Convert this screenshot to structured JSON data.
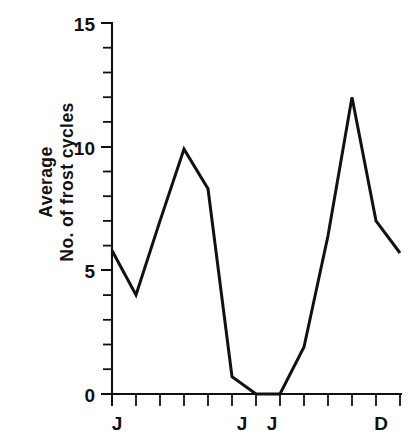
{
  "chart_data": {
    "type": "line",
    "title": "",
    "subtitle": "",
    "xlabel": "",
    "ylabel": "Average No. of frost cycles",
    "ylabel_lines": [
      "Average",
      "No. of frost cycles"
    ],
    "x": [
      "J",
      "F",
      "M",
      "A",
      "M",
      "J",
      "J",
      "A",
      "S",
      "O",
      "N",
      "D",
      ""
    ],
    "categories": [
      "J",
      "F",
      "M",
      "A",
      "M",
      "J",
      "J",
      "A",
      "S",
      "O",
      "N",
      "D",
      ""
    ],
    "values": [
      5.8,
      4.0,
      7.0,
      9.9,
      8.3,
      0.7,
      0.0,
      0.0,
      1.9,
      6.4,
      12.0,
      7.0,
      5.7
    ],
    "series": [
      {
        "name": "Average No. of frost cycles",
        "values": [
          5.8,
          4.0,
          7.0,
          9.9,
          8.3,
          0.7,
          0.0,
          0.0,
          1.9,
          6.4,
          12.0,
          7.0,
          5.7
        ]
      }
    ],
    "ylim": [
      0,
      15
    ],
    "xlim": [
      0,
      12
    ],
    "y_ticks_major": [
      0,
      5,
      10,
      15
    ],
    "y_ticks_major_labels": [
      "0",
      "5",
      "10",
      "15"
    ],
    "y_ticks_minor": [
      1,
      2,
      3,
      4,
      6,
      7,
      8,
      9,
      11,
      12,
      13,
      14
    ],
    "y_tick_step": 1,
    "x_tick_count": 13,
    "x_tick_labels": [
      {
        "index": 0,
        "label": "J"
      },
      {
        "index": 5,
        "label": "J"
      },
      {
        "index": 6,
        "label": "J"
      },
      {
        "index": 11,
        "label": "D"
      }
    ],
    "grid": false,
    "legend": null,
    "legend_position": "none",
    "line_color": "#111111",
    "background_color": "#ffffff",
    "markers": false,
    "annotations": []
  },
  "axes": {
    "y_axis_name": "y-axis",
    "x_axis_name": "x-axis"
  }
}
